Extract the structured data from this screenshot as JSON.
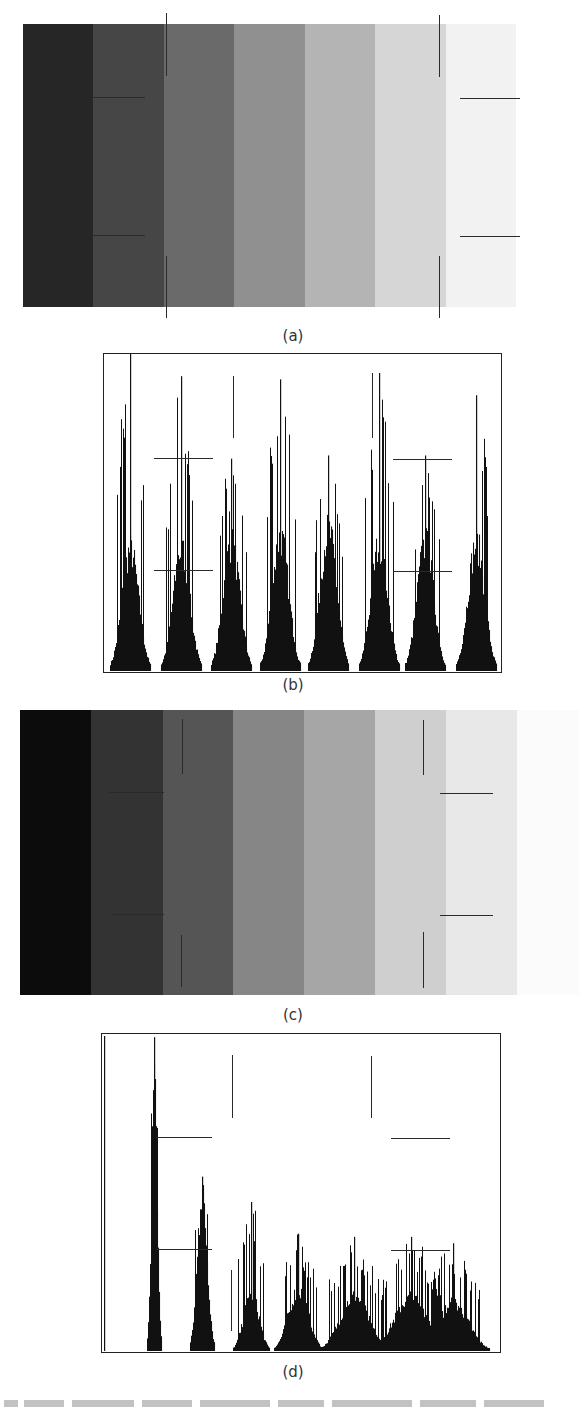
{
  "figure": {
    "panels": [
      {
        "id": "a",
        "type": "image",
        "caption": "(a)",
        "description": "Seven-step gray wedge with added noise",
        "box": {
          "x": 23,
          "y": 24,
          "w": 493,
          "h": 283
        },
        "band_colors": [
          "#262626",
          "#464646",
          "#6a6a6a",
          "#909090",
          "#b4b4b4",
          "#d6d6d6",
          "#f2f2f2"
        ],
        "caption_pos": {
          "x": 263,
          "y": 327
        }
      },
      {
        "id": "b",
        "type": "histogram",
        "caption": "(b)",
        "caption_pos": {
          "x": 263,
          "y": 676
        }
      },
      {
        "id": "c",
        "type": "image",
        "caption": "(c)",
        "description": "Gray wedge after contrast stretch / transformation",
        "box": {
          "x": 20,
          "y": 710,
          "w": 559,
          "h": 285
        },
        "band_colors": [
          "#0c0c0c",
          "#333333",
          "#555555",
          "#868686",
          "#a6a6a6",
          "#cfcfcf",
          "#e8e8e8",
          "#fbfbfb"
        ],
        "band_widths": [
          71,
          72,
          70,
          71,
          71,
          71,
          71,
          62
        ],
        "caption_pos": {
          "x": 263,
          "y": 1006
        }
      },
      {
        "id": "d",
        "type": "histogram",
        "caption": "(d)",
        "caption_pos": {
          "x": 263,
          "y": 1363
        }
      }
    ]
  },
  "chart_data": [
    {
      "type": "bar",
      "title": "(b) Histogram of noisy seven-level gray image",
      "xlabel": "",
      "ylabel": "",
      "grid": false,
      "frame": {
        "x": 103,
        "y": 353,
        "w": 399,
        "h": 320
      },
      "peaks": [
        {
          "center": 129,
          "spike": 1.0,
          "body": 0.38,
          "width": 20
        },
        {
          "center": 180,
          "spike": 0.93,
          "body": 0.38,
          "width": 20
        },
        {
          "center": 230,
          "spike": 0.67,
          "body": 0.4,
          "width": 20
        },
        {
          "center": 279,
          "spike": 0.92,
          "body": 0.42,
          "width": 20
        },
        {
          "center": 327,
          "spike": 0.68,
          "body": 0.44,
          "width": 20
        },
        {
          "center": 378,
          "spike": 0.94,
          "body": 0.4,
          "width": 20
        },
        {
          "center": 424,
          "spike": 0.68,
          "body": 0.4,
          "width": 20
        },
        {
          "center": 475,
          "spike": 0.87,
          "body": 0.4,
          "width": 20
        }
      ]
    },
    {
      "type": "bar",
      "title": "(d) Histogram after transformation",
      "xlabel": "",
      "ylabel": "",
      "grid": false,
      "frame": {
        "x": 101,
        "y": 1033,
        "w": 400,
        "h": 320
      },
      "peaks": [
        {
          "center": 153,
          "spike": 0.99,
          "body": 0.82,
          "width": 7
        },
        {
          "center": 201,
          "spike": 0.55,
          "body": 0.48,
          "width": 12
        },
        {
          "center": 250,
          "spike": 0.47,
          "body": 0.18,
          "width": 18
        },
        {
          "center": 297,
          "spike": 0.37,
          "body": 0.19,
          "width": 24
        },
        {
          "center": 353,
          "spike": 0.36,
          "body": 0.17,
          "width": 34
        },
        {
          "center": 410,
          "spike": 0.36,
          "body": 0.17,
          "width": 40
        },
        {
          "center": 452,
          "spike": 0.34,
          "body": 0.15,
          "width": 36
        }
      ]
    }
  ],
  "crop_marks": {
    "a": [
      {
        "o": "v",
        "x": 166,
        "y1": 13,
        "y2": 76
      },
      {
        "o": "v",
        "x": 439,
        "y1": 15,
        "y2": 77
      },
      {
        "o": "v",
        "x": 166,
        "y1": 256,
        "y2": 318
      },
      {
        "o": "v",
        "x": 439,
        "y1": 256,
        "y2": 318
      },
      {
        "o": "h",
        "y": 97,
        "x1": 91,
        "x2": 145
      },
      {
        "o": "h",
        "y": 235,
        "x1": 88,
        "x2": 145
      },
      {
        "o": "h",
        "y": 98,
        "x1": 460,
        "x2": 520
      },
      {
        "o": "h",
        "y": 236,
        "x1": 460,
        "x2": 520
      }
    ],
    "b": [
      {
        "o": "v",
        "x": 233,
        "y1": 376,
        "y2": 438
      },
      {
        "o": "v",
        "x": 372,
        "y1": 373,
        "y2": 438
      },
      {
        "o": "h",
        "y": 458,
        "x1": 154,
        "x2": 213
      },
      {
        "o": "h",
        "y": 570,
        "x1": 154,
        "x2": 213
      },
      {
        "o": "h",
        "y": 459,
        "x1": 393,
        "x2": 452
      },
      {
        "o": "h",
        "y": 571,
        "x1": 393,
        "x2": 452
      }
    ],
    "c": [
      {
        "o": "v",
        "x": 182,
        "y1": 719,
        "y2": 774
      },
      {
        "o": "v",
        "x": 181,
        "y1": 935,
        "y2": 987
      },
      {
        "o": "v",
        "x": 423,
        "y1": 720,
        "y2": 775
      },
      {
        "o": "v",
        "x": 423,
        "y1": 932,
        "y2": 988
      },
      {
        "o": "h",
        "y": 792,
        "x1": 109,
        "x2": 164
      },
      {
        "o": "h",
        "y": 914,
        "x1": 111,
        "x2": 164
      },
      {
        "o": "h",
        "y": 793,
        "x1": 440,
        "x2": 493
      },
      {
        "o": "h",
        "y": 915,
        "x1": 440,
        "x2": 493
      }
    ],
    "d": [
      {
        "o": "v",
        "x": 232,
        "y1": 1055,
        "y2": 1118
      },
      {
        "o": "v",
        "x": 231,
        "y1": 1270,
        "y2": 1331
      },
      {
        "o": "v",
        "x": 371,
        "y1": 1056,
        "y2": 1118
      },
      {
        "o": "h",
        "y": 1137,
        "x1": 156,
        "x2": 212
      },
      {
        "o": "h",
        "y": 1249,
        "x1": 156,
        "x2": 212
      },
      {
        "o": "h",
        "y": 1138,
        "x1": 391,
        "x2": 450
      },
      {
        "o": "h",
        "y": 1250,
        "x1": 391,
        "x2": 450
      }
    ]
  },
  "bottom_text_clipped": true
}
